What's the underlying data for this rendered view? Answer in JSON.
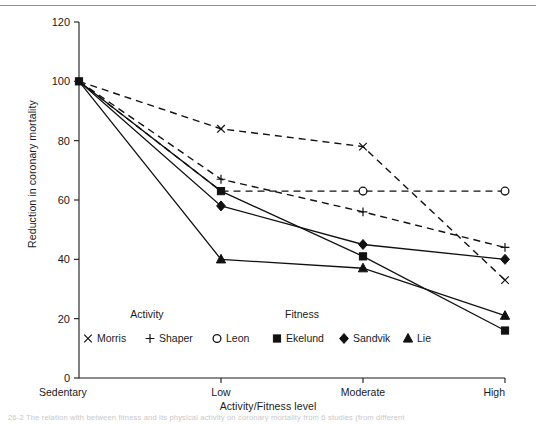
{
  "figure": {
    "top_rule": true,
    "caption_fragment": "26-2   The relation with between fitness and its physical activity on coronary mortality from 6 studies (from different"
  },
  "chart_data": {
    "type": "line",
    "title": "",
    "xlabel": "Activity/Fitness level",
    "ylabel": "Reduction in coronary mortality",
    "categories": [
      "Sedentary",
      "Low",
      "Moderate",
      "High"
    ],
    "x": [
      0,
      1,
      2,
      3
    ],
    "ylim": [
      0,
      120
    ],
    "yticks": [
      0,
      20,
      40,
      60,
      80,
      100,
      120
    ],
    "ytick_labels": [
      "0",
      "20",
      "40",
      "60",
      "80",
      "100",
      "120"
    ],
    "grid": false,
    "legend_position": "inside-lower-center",
    "legend_groups": [
      {
        "name": "Activity",
        "style": "dashed",
        "entries": [
          {
            "label": "Morris",
            "marker": "x"
          },
          {
            "label": "Shaper",
            "marker": "plus"
          },
          {
            "label": "Leon",
            "marker": "circle-open"
          }
        ]
      },
      {
        "name": "Fitness",
        "style": "solid",
        "entries": [
          {
            "label": "Ekelund",
            "marker": "square"
          },
          {
            "label": "Sandvik",
            "marker": "diamond"
          },
          {
            "label": "Lie",
            "marker": "triangle"
          }
        ]
      }
    ],
    "series": [
      {
        "name": "Morris",
        "group": "Activity",
        "marker": "x",
        "style": "dashed",
        "values": [
          100,
          84,
          78,
          33
        ]
      },
      {
        "name": "Shaper",
        "group": "Activity",
        "marker": "plus",
        "style": "dashed",
        "values": [
          100,
          67,
          56,
          44
        ]
      },
      {
        "name": "Leon",
        "group": "Activity",
        "marker": "circle-open",
        "style": "dashed",
        "values": [
          100,
          63,
          63,
          63
        ]
      },
      {
        "name": "Ekelund",
        "group": "Fitness",
        "marker": "square",
        "style": "solid",
        "values": [
          100,
          63,
          41,
          16
        ]
      },
      {
        "name": "Sandvik",
        "group": "Fitness",
        "marker": "diamond",
        "style": "solid",
        "values": [
          100,
          58,
          45,
          40
        ]
      },
      {
        "name": "Lie",
        "group": "Fitness",
        "marker": "triangle",
        "style": "solid",
        "values": [
          100,
          40,
          37,
          21
        ]
      }
    ]
  }
}
